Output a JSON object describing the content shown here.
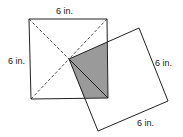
{
  "diagram": {
    "labels": {
      "square1_top": "6 in.",
      "square1_left": "6 in.",
      "square2_right": "6 in.",
      "square2_bottom": "6 in."
    },
    "colors": {
      "stroke": "#222222",
      "shade": "#9a9a9a",
      "background": "#ffffff"
    },
    "square1": {
      "corners": [
        [
          29,
          19
        ],
        [
          107,
          19
        ],
        [
          108,
          98
        ],
        [
          31,
          99
        ]
      ]
    },
    "square2": {
      "corners": [
        [
          69,
          59
        ],
        [
          139,
          28
        ],
        [
          168,
          101
        ],
        [
          98,
          131
        ]
      ]
    },
    "shaded_region": {
      "points": [
        [
          69,
          59
        ],
        [
          107,
          42
        ],
        [
          108,
          98
        ],
        [
          84,
          98
        ]
      ]
    }
  }
}
